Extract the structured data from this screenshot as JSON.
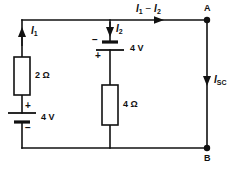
{
  "diagram": {
    "type": "electrical-circuit",
    "stroke_color": "#111111",
    "background_color": "#ffffff",
    "labels": {
      "current_left": "I",
      "current_left_sub": "1",
      "current_middle": "I",
      "current_middle_sub": "2",
      "current_top_first": "I",
      "current_top_first_sub": "1",
      "current_top_operator": " − ",
      "current_top_second": "I",
      "current_top_second_sub": "2",
      "current_short": "I",
      "current_short_sub": "SC",
      "resistor_left": "2 Ω",
      "resistor_middle": "4 Ω",
      "source_left": "4 V",
      "source_middle": "4 V",
      "node_a": "A",
      "node_b": "B",
      "plus_left": "+",
      "minus_left": "−",
      "plus_middle": "+",
      "minus_middle": "−"
    },
    "components": [
      {
        "name": "resistor-2ohm",
        "value": "2 Ω",
        "branch": "left"
      },
      {
        "name": "voltage-source-left",
        "value": "4 V",
        "branch": "left",
        "polarity_top": "+",
        "polarity_bottom": "−"
      },
      {
        "name": "voltage-source-middle",
        "value": "4 V",
        "branch": "middle",
        "polarity_top": "−",
        "polarity_bottom": "+"
      },
      {
        "name": "resistor-4ohm",
        "value": "4 Ω",
        "branch": "middle"
      },
      {
        "name": "terminal-a",
        "value": "A",
        "branch": "right"
      },
      {
        "name": "terminal-b",
        "value": "B",
        "branch": "right"
      }
    ],
    "currents": [
      {
        "name": "I1",
        "branch": "left",
        "direction": "up"
      },
      {
        "name": "I2",
        "branch": "middle",
        "direction": "down"
      },
      {
        "name": "I1 - I2",
        "branch": "top",
        "direction": "right"
      },
      {
        "name": "ISC",
        "branch": "right",
        "direction": "down"
      }
    ]
  }
}
